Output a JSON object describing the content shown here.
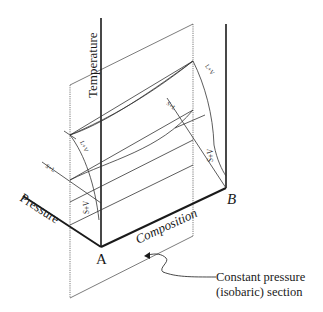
{
  "diagram": {
    "axes": {
      "temperature_label": "Temperature",
      "pressure_label": "Pressure",
      "composition_label": "Composition"
    },
    "points": {
      "a_label": "A",
      "b_label": "B"
    },
    "regions": {
      "left_lv": "L+V",
      "left_sl": "S+L",
      "left_sv": "S+V",
      "right_lv": "L+V",
      "right_sl": "S+L",
      "right_sv": "S+V"
    },
    "callout": {
      "line1": "Constant pressure",
      "line2": "(isobaric) section"
    },
    "colors": {
      "ink": "#1a1a1a",
      "thin": "#333333",
      "background": "#ffffff"
    }
  }
}
